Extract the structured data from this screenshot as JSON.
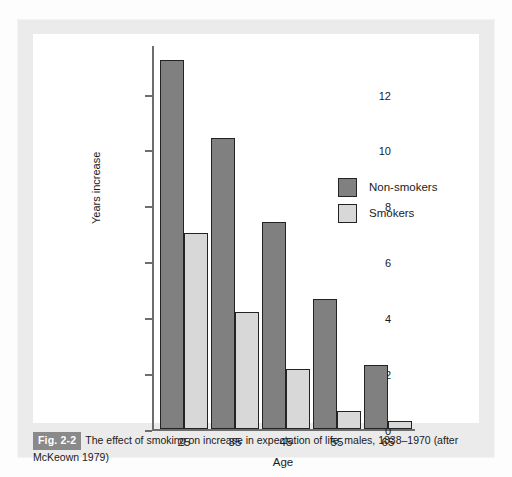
{
  "figure": {
    "badge": "Fig. 2-2",
    "caption_text": "The effect of smoking on increase in expectation of life: males, 1838–1970 (after McKeown 1979)"
  },
  "colors": {
    "non_smokers": "#808080",
    "smokers": "#d8d8d8",
    "bar_border": "#232323",
    "axis": "#6d6d6d",
    "badge_bg": "#8a8a8a",
    "panel_bg": "#ebebeb",
    "plot_bg": "#ffffff"
  },
  "chart_data": {
    "type": "bar",
    "title": "",
    "subtitle": "",
    "xlabel": "Age",
    "ylabel": "Years increase",
    "categories": [
      "25",
      "35",
      "45",
      "55",
      "65"
    ],
    "series": [
      {
        "name": "Non-smokers",
        "values": [
          13.2,
          10.4,
          7.4,
          4.65,
          2.3
        ],
        "color": "#808080"
      },
      {
        "name": "Smokers",
        "values": [
          7.0,
          4.2,
          2.15,
          0.65,
          0.3
        ],
        "color": "#d8d8d8"
      }
    ],
    "ylim": [
      0,
      13.7
    ],
    "yticks": [
      0,
      2,
      4,
      6,
      8,
      10,
      12
    ],
    "ytick_labels": [
      "0",
      "2",
      "4",
      "6",
      "8",
      "10",
      "12"
    ],
    "xtick_labels": [
      "25",
      "35",
      "45",
      "55",
      "65"
    ],
    "grid": false,
    "legend_position": "inside-upper-right",
    "legend_entries": [
      "Non-smokers",
      "Smokers"
    ]
  }
}
